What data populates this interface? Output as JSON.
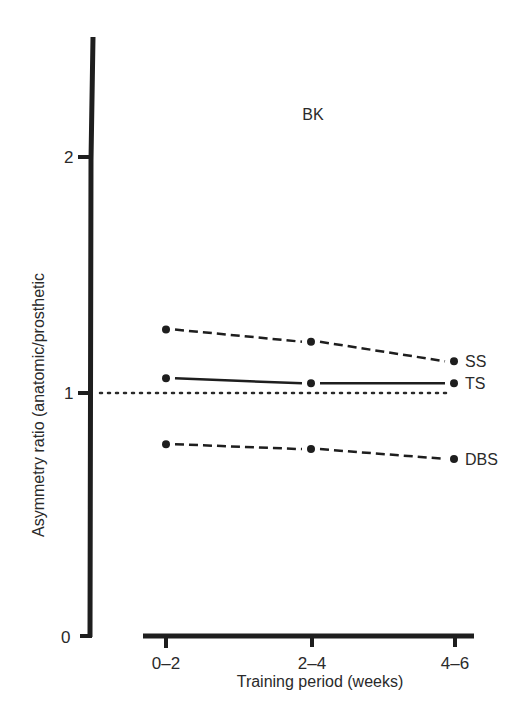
{
  "chart_data": {
    "type": "line",
    "title": "BK",
    "xlabel": "Training period (weeks)",
    "ylabel": "Asymmetry ratio (anatomic/prosthetic",
    "categories": [
      "0–2",
      "2–4",
      "4–6"
    ],
    "yticks": [
      "0",
      "1",
      "2"
    ],
    "ylim": [
      0,
      2.5
    ],
    "grid": false,
    "reference_line": {
      "y": 1.0,
      "style": "dotted"
    },
    "series": [
      {
        "name": "SS",
        "style": "dashed",
        "values": [
          1.26,
          1.21,
          1.13
        ]
      },
      {
        "name": "TS",
        "style": "solid",
        "values": [
          1.06,
          1.04,
          1.04
        ]
      },
      {
        "name": "DBS",
        "style": "dashed",
        "values": [
          0.79,
          0.77,
          0.73
        ]
      }
    ],
    "legend_position": "inline-right"
  }
}
